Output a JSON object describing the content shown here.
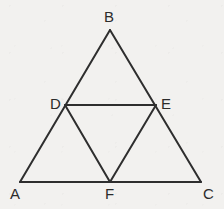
{
  "figure": {
    "kind": "geometry-diagram",
    "shape": "triangle-with-midsegments",
    "width": 224,
    "height": 209,
    "background_color": "#f2f1ef",
    "stroke_color": "#2e2e2e",
    "stroke_width": 2,
    "label_color": "#2b2b2b",
    "points": {
      "A": {
        "label": "A",
        "x": 20,
        "y": 182,
        "label_x": 10,
        "label_y": 186
      },
      "B": {
        "label": "B",
        "x": 110,
        "y": 30,
        "label_x": 104,
        "label_y": 9
      },
      "C": {
        "label": "C",
        "x": 201,
        "y": 182,
        "label_x": 203,
        "label_y": 186
      },
      "D": {
        "label": "D",
        "x": 65,
        "y": 105,
        "label_x": 50,
        "label_y": 96
      },
      "E": {
        "label": "E",
        "x": 156,
        "y": 105,
        "label_x": 161,
        "label_y": 96
      },
      "F": {
        "label": "F",
        "x": 110,
        "y": 182,
        "label_x": 105,
        "label_y": 186
      }
    },
    "segments": [
      {
        "name": "segment-AB",
        "from": "A",
        "to": "B"
      },
      {
        "name": "segment-BC",
        "from": "B",
        "to": "C"
      },
      {
        "name": "segment-AC",
        "from": "A",
        "to": "C"
      },
      {
        "name": "segment-DE",
        "from": "D",
        "to": "E"
      },
      {
        "name": "segment-DF",
        "from": "D",
        "to": "F"
      },
      {
        "name": "segment-EF",
        "from": "E",
        "to": "F"
      }
    ]
  }
}
